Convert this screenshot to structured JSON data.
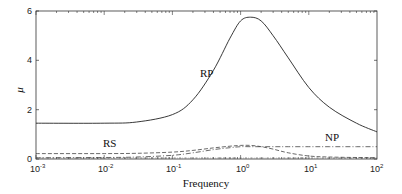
{
  "chart_data": {
    "type": "line",
    "title": "",
    "xlabel": "Frequency",
    "ylabel": "μ",
    "xscale": "log",
    "xlim": [
      0.001,
      100
    ],
    "ylim": [
      0,
      6
    ],
    "grid": false,
    "x_ticks": [
      "10^-3",
      "10^-2",
      "10^-1",
      "10^0",
      "10^1",
      "10^2"
    ],
    "y_ticks": [
      "0",
      "2",
      "4",
      "6"
    ],
    "x": [
      0.001,
      0.01,
      0.03,
      0.1,
      0.2,
      0.4,
      0.7,
      1.0,
      1.4,
      2.0,
      3.0,
      5.0,
      10,
      20,
      50,
      100
    ],
    "series": [
      {
        "name": "RP",
        "style": "solid",
        "values": [
          1.45,
          1.45,
          1.5,
          1.8,
          2.4,
          3.6,
          4.9,
          5.6,
          5.75,
          5.6,
          5.0,
          4.1,
          2.9,
          2.1,
          1.45,
          1.1
        ]
      },
      {
        "name": "NP",
        "style": "dash-dot",
        "values": [
          0.05,
          0.06,
          0.08,
          0.15,
          0.25,
          0.38,
          0.46,
          0.5,
          0.5,
          0.5,
          0.5,
          0.5,
          0.5,
          0.5,
          0.5,
          0.5
        ]
      },
      {
        "name": "RS",
        "style": "dashed",
        "values": [
          0.22,
          0.22,
          0.23,
          0.28,
          0.35,
          0.45,
          0.52,
          0.55,
          0.55,
          0.5,
          0.4,
          0.25,
          0.12,
          0.08,
          0.06,
          0.05
        ]
      }
    ],
    "annotations": [
      {
        "text": "RP",
        "x": 0.5,
        "y": 4.6
      },
      {
        "text": "RS",
        "x": 0.006,
        "y": 0.45
      },
      {
        "text": "NP",
        "x": 18,
        "y": 0.9
      }
    ]
  },
  "labels": {
    "xlabel": "Frequency",
    "ylabel": "μ",
    "rp": "RP",
    "rs": "RS",
    "np": "NP",
    "y0": "0",
    "y2": "2",
    "y4": "4",
    "y6": "6",
    "xbase": "10",
    "xexp": [
      "-3",
      "-2",
      "-1",
      "0",
      "1",
      "2"
    ]
  }
}
